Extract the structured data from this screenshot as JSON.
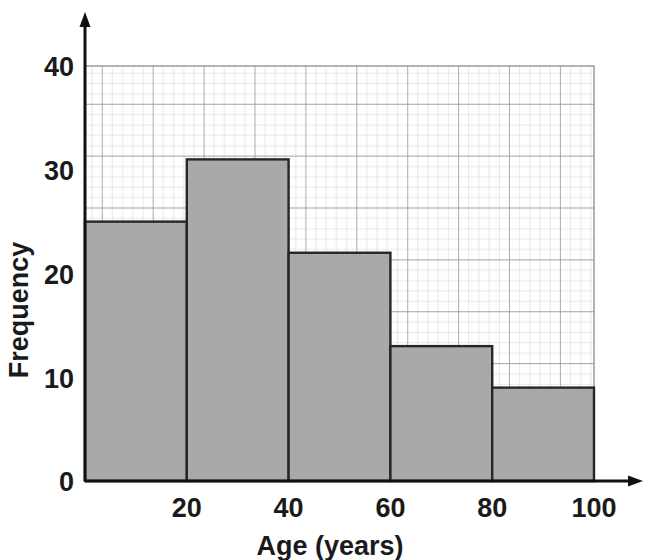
{
  "chart_data": {
    "type": "bar",
    "title": "",
    "subtitle": "",
    "xlabel": "Age (years)",
    "ylabel": "Frequency",
    "categories": [
      "0-20",
      "20-40",
      "40-60",
      "60-80",
      "80-100"
    ],
    "bin_edges": [
      0,
      20,
      40,
      60,
      80,
      100
    ],
    "values": [
      25,
      31,
      22,
      13,
      9
    ],
    "x_tick_labels": [
      "20",
      "40",
      "60",
      "80",
      "100"
    ],
    "x_tick_values": [
      20,
      40,
      60,
      80,
      100
    ],
    "y_tick_labels": [
      "0",
      "10",
      "20",
      "30",
      "40"
    ],
    "y_tick_values": [
      0,
      10,
      20,
      30,
      40
    ],
    "xlim": [
      0,
      100
    ],
    "ylim": [
      0,
      40
    ],
    "grid": true,
    "grid_minor_step_x": 2,
    "grid_minor_step_y": 1,
    "grid_major_step_x": 10,
    "grid_major_step_y": 5,
    "legend": false,
    "legend_position": "none",
    "bar_fill_color": "#a9a9a9",
    "bar_edge_color": "#262626",
    "axis_color": "#111111",
    "grid_minor_color": "#c9c9c9",
    "grid_major_color": "#8f8f8f",
    "background_color": "#ffffff",
    "annotations": []
  },
  "axes": {
    "x_title": "Age (years)",
    "y_title": "Frequency"
  },
  "icons": {
    "x_arrow": "arrow-right-icon",
    "y_arrow": "arrow-up-icon"
  }
}
